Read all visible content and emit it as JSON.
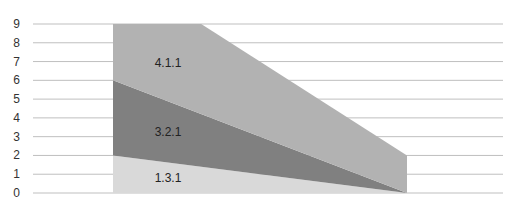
{
  "chart_data": {
    "type": "area",
    "stacked": true,
    "title": "",
    "xlabel": "",
    "ylabel": "",
    "ylim": [
      0,
      9
    ],
    "y_ticks": [
      0,
      1,
      2,
      3,
      4,
      5,
      6,
      7,
      8,
      9
    ],
    "grid": true,
    "legend": "none",
    "categories": [
      "Start",
      "End"
    ],
    "series": [
      {
        "name": "1.3.1",
        "values": [
          2,
          0
        ],
        "color": "#d9d9d9"
      },
      {
        "name": "3.2.1",
        "values": [
          4,
          0
        ],
        "color": "#808080"
      },
      {
        "name": "4.1.1",
        "values": [
          6,
          2
        ],
        "color": "#b2b2b2"
      }
    ],
    "annotations": [
      "1.3.1",
      "3.2.1",
      "4.1.1"
    ]
  }
}
